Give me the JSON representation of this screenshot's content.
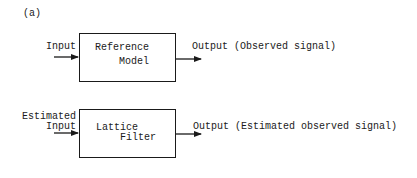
{
  "panel_label": "(a)",
  "blocks": [
    {
      "name": "reference-model",
      "title_line1": "Reference",
      "title_line2": "Model",
      "input_label": "Input",
      "output_label": "Output (Observed signal)"
    },
    {
      "name": "lattice-filter",
      "title_line1": "Lattice",
      "title_line2": "Filter",
      "input_label_line1": "Estimated",
      "input_label_line2": "Input",
      "output_label": "Output (Estimated observed signal)"
    }
  ]
}
